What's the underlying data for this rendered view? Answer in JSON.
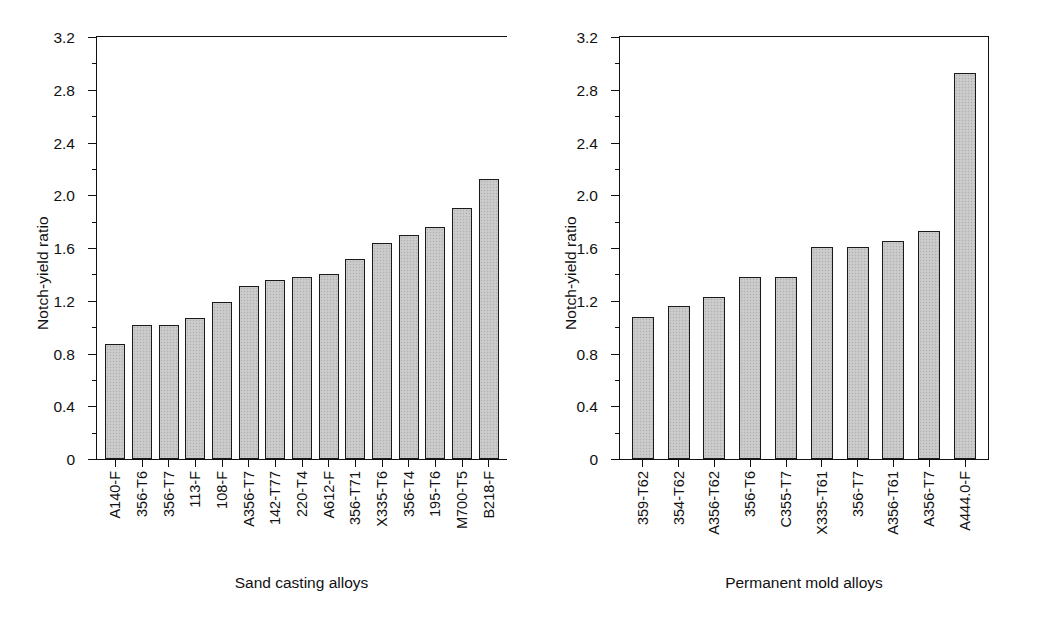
{
  "chart_data": [
    {
      "type": "bar",
      "panel": "left",
      "title": "",
      "xlabel": "Sand casting alloys",
      "ylabel": "Notch-yield ratio",
      "ylim": [
        0,
        3.2
      ],
      "ytick_step": 0.4,
      "yticks": [
        "3.2",
        "2.8",
        "2.4",
        "2.0",
        "1.6",
        "1.2",
        "0.8",
        "0.4",
        "0"
      ],
      "grid": false,
      "legend": "none",
      "categories": [
        "A140-F",
        "356-T6",
        "356-T7",
        "113-F",
        "108-F",
        "A356-T7",
        "142-T77",
        "220-T4",
        "A612-F",
        "356-T71",
        "X335-T6",
        "356-T4",
        "195-T6",
        "M700-T5",
        "B218-F"
      ],
      "values": [
        0.87,
        1.02,
        1.02,
        1.07,
        1.19,
        1.31,
        1.36,
        1.38,
        1.4,
        1.52,
        1.64,
        1.7,
        1.76,
        1.9,
        2.12
      ]
    },
    {
      "type": "bar",
      "panel": "right",
      "title": "",
      "xlabel": "Permanent mold alloys",
      "ylabel": "Notch-yield ratio",
      "ylim": [
        0,
        3.2
      ],
      "ytick_step": 0.4,
      "yticks": [
        "3.2",
        "2.8",
        "2.4",
        "2.0",
        "1.6",
        "1.2",
        "0.8",
        "0.4",
        "0"
      ],
      "grid": false,
      "legend": "none",
      "categories": [
        "359-T62",
        "354-T62",
        "A356-T62",
        "356-T6",
        "C355-T7",
        "X335-T61",
        "356-T7",
        "A356-T61",
        "A356-T7",
        "A444.0-F"
      ],
      "values": [
        1.08,
        1.16,
        1.23,
        1.38,
        1.38,
        1.61,
        1.61,
        1.65,
        1.73,
        2.93
      ]
    }
  ],
  "style": {
    "bar_fill": "#c7c7c7",
    "bar_border": "#1a1a1a",
    "axis_color": "#111111",
    "background": "#ffffff"
  }
}
